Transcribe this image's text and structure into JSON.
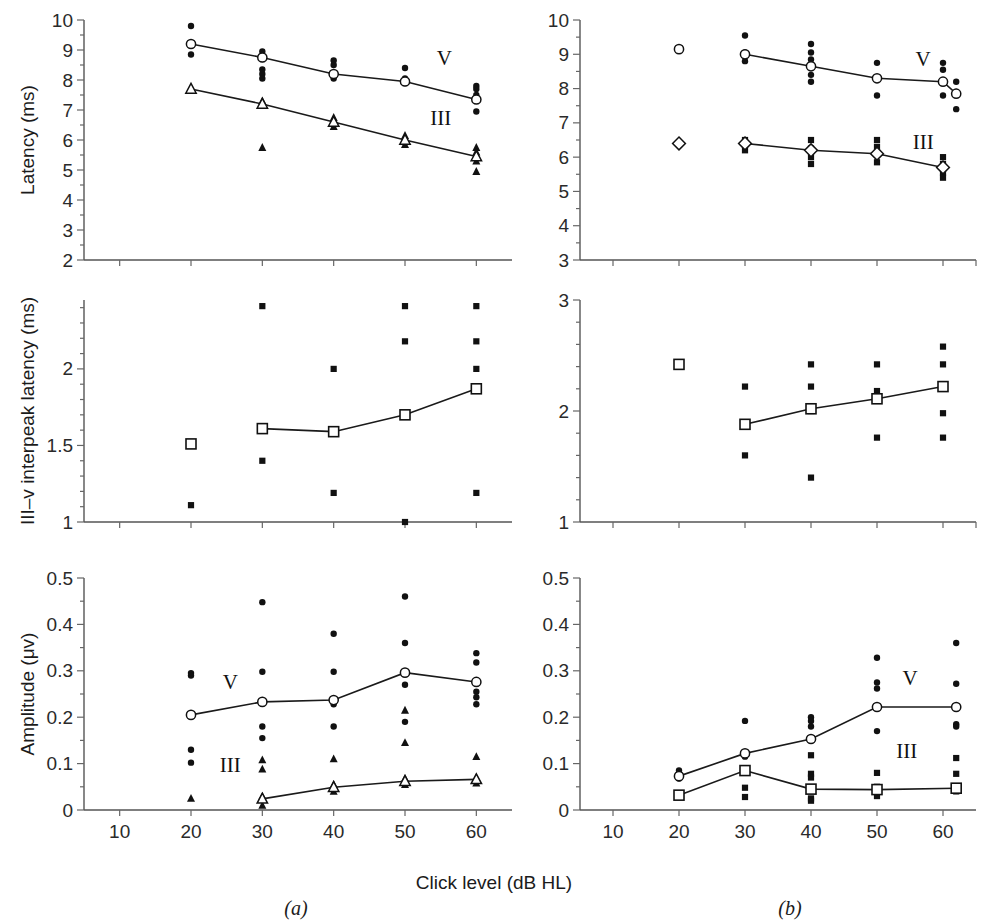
{
  "figure": {
    "xlabel": "Click level (dB HL)",
    "caption_a": "(a)",
    "caption_b": "(b)",
    "series_label_v": "V",
    "series_label_iii": "III",
    "colors": {
      "ink": "#111111",
      "axis": "#555555",
      "background": "#ffffff"
    }
  },
  "chart_data": [
    {
      "id": "panel-a-latency",
      "type": "scatter",
      "title": "",
      "panel": "(a)",
      "xlabel": "Click level (dB HL)",
      "ylabel": "Latency (ms)",
      "xlim": [
        5,
        65
      ],
      "ylim": [
        2,
        10
      ],
      "xticks": [
        10,
        20,
        30,
        40,
        50,
        60
      ],
      "yticks": [
        2,
        3,
        4,
        5,
        6,
        7,
        8,
        9,
        10
      ],
      "grid": false,
      "legend": [
        "V",
        "III"
      ],
      "legend_position": "inline-right",
      "series": [
        {
          "name": "V",
          "marker": "open-circle",
          "x": [
            20,
            30,
            40,
            50,
            60
          ],
          "values": [
            9.2,
            8.75,
            8.2,
            7.95,
            7.35
          ],
          "scatter": {
            "20": [
              9.8,
              9.2,
              8.85
            ],
            "30": [
              8.95,
              8.8,
              8.7,
              8.35,
              8.2,
              8.05
            ],
            "40": [
              8.65,
              8.5,
              8.2,
              8.05
            ],
            "50": [
              8.4,
              8.05,
              7.95,
              7.9
            ],
            "60": [
              7.8,
              7.7,
              7.5,
              7.35,
              6.95
            ]
          }
        },
        {
          "name": "III",
          "marker": "open-triangle",
          "x": [
            20,
            30,
            40,
            50,
            60
          ],
          "values": [
            7.7,
            7.2,
            6.6,
            6.0,
            5.45
          ],
          "scatter": {
            "20": [
              7.7
            ],
            "30": [
              7.3,
              7.2,
              5.75
            ],
            "40": [
              6.75,
              6.6,
              6.45
            ],
            "50": [
              6.15,
              6.0,
              5.85
            ],
            "60": [
              5.75,
              5.6,
              5.45,
              5.3,
              4.95
            ]
          }
        }
      ]
    },
    {
      "id": "panel-b-latency",
      "type": "scatter",
      "title": "",
      "panel": "(b)",
      "xlabel": "Click level (dB HL)",
      "ylabel": "Latency (ms)",
      "xlim": [
        5,
        65
      ],
      "ylim": [
        3,
        10
      ],
      "xticks": [
        10,
        20,
        30,
        40,
        50,
        60
      ],
      "yticks": [
        3,
        4,
        5,
        6,
        7,
        8,
        9,
        10
      ],
      "grid": false,
      "legend": [
        "V",
        "III"
      ],
      "legend_position": "inline-right",
      "series": [
        {
          "name": "V",
          "marker": "open-circle",
          "x": [
            30,
            40,
            50,
            60
          ],
          "values": [
            9.0,
            8.65,
            8.3,
            8.2
          ],
          "isolated": {
            "20": [
              9.15
            ]
          },
          "scatter": {
            "30": [
              9.55,
              9.05,
              8.95,
              8.8
            ],
            "40": [
              9.3,
              9.05,
              8.85,
              8.65,
              8.4,
              8.2
            ],
            "50": [
              8.75,
              8.3,
              7.8
            ],
            "60": [
              8.75,
              8.55,
              8.2,
              7.8
            ]
          },
          "last_x": 62,
          "last_value": 7.85,
          "last_scatter": [
            8.2,
            7.9,
            7.85,
            7.4
          ]
        },
        {
          "name": "III",
          "marker": "open-diamond",
          "x": [
            30,
            40,
            50,
            60
          ],
          "values": [
            6.4,
            6.2,
            6.1,
            5.7
          ],
          "isolated": {
            "20": [
              6.4
            ]
          },
          "scatter": {
            "30": [
              6.5,
              6.4,
              6.2
            ],
            "40": [
              6.5,
              6.25,
              6.0,
              5.8
            ],
            "50": [
              6.5,
              6.3,
              6.1,
              5.85
            ],
            "60": [
              6.0,
              5.8,
              5.7,
              5.55,
              5.4
            ]
          }
        }
      ]
    },
    {
      "id": "panel-a-interpeak",
      "type": "scatter",
      "title": "",
      "panel": "(a)",
      "xlabel": "Click level (dB HL)",
      "ylabel": "III–v interpeak latency (ms)",
      "xlim": [
        5,
        65
      ],
      "ylim": [
        1,
        2.45
      ],
      "xticks": [
        10,
        20,
        30,
        40,
        50,
        60
      ],
      "yticks": [
        1,
        1.5,
        2
      ],
      "grid": false,
      "series": [
        {
          "name": "III-V interpeak",
          "marker": "open-square",
          "x": [
            30,
            40,
            50,
            60
          ],
          "values": [
            1.61,
            1.59,
            1.7,
            1.87
          ],
          "isolated": {
            "20": [
              1.51
            ]
          },
          "scatter": {
            "20": [
              1.51,
              1.11
            ],
            "30": [
              2.41,
              1.62,
              1.6,
              1.4
            ],
            "40": [
              2.0,
              1.6,
              1.19
            ],
            "50": [
              2.41,
              2.18,
              1.7,
              1.0
            ],
            "60": [
              2.41,
              2.18,
              2.0,
              1.87,
              1.19
            ]
          }
        }
      ]
    },
    {
      "id": "panel-b-interpeak",
      "type": "scatter",
      "title": "",
      "panel": "(b)",
      "xlabel": "Click level (dB HL)",
      "ylabel": "III–v interpeak latency (ms)",
      "xlim": [
        5,
        65
      ],
      "ylim": [
        1,
        3
      ],
      "xticks": [
        10,
        20,
        30,
        40,
        50,
        60
      ],
      "yticks": [
        1,
        2,
        3
      ],
      "grid": false,
      "series": [
        {
          "name": "III-V interpeak",
          "marker": "open-square",
          "x": [
            30,
            40,
            50,
            60
          ],
          "values": [
            1.88,
            2.02,
            2.11,
            2.22
          ],
          "isolated": {
            "20": [
              2.42
            ]
          },
          "scatter": {
            "20": [
              2.42
            ],
            "30": [
              2.22,
              1.88,
              1.6
            ],
            "40": [
              2.42,
              2.22,
              2.0,
              1.4
            ],
            "50": [
              2.42,
              2.18,
              2.11,
              1.76
            ],
            "60": [
              2.58,
              2.42,
              2.22,
              1.98,
              1.76
            ]
          }
        }
      ]
    },
    {
      "id": "panel-a-amplitude",
      "type": "scatter",
      "title": "",
      "panel": "(a)",
      "xlabel": "Click level (dB HL)",
      "ylabel": "Amplitude (μv)",
      "xlim": [
        5,
        65
      ],
      "ylim": [
        0,
        0.5
      ],
      "xticks": [
        10,
        20,
        30,
        40,
        50,
        60
      ],
      "yticks": [
        0,
        0.1,
        0.2,
        0.3,
        0.4,
        0.5
      ],
      "grid": false,
      "legend": [
        "V",
        "III"
      ],
      "series": [
        {
          "name": "V",
          "marker": "open-circle",
          "x": [
            20,
            30,
            40,
            50,
            60
          ],
          "values": [
            0.205,
            0.233,
            0.237,
            0.296,
            0.276
          ],
          "scatter": {
            "20": [
              0.295,
              0.29,
              0.205,
              0.13,
              0.102
            ],
            "30": [
              0.448,
              0.298,
              0.233,
              0.18,
              0.155
            ],
            "40": [
              0.38,
              0.298,
              0.237,
              0.228,
              0.18
            ],
            "50": [
              0.46,
              0.36,
              0.296,
              0.27,
              0.19
            ],
            "60": [
              0.338,
              0.318,
              0.276,
              0.255,
              0.243,
              0.228
            ]
          }
        },
        {
          "name": "III",
          "marker": "open-triangle",
          "x": [
            30,
            40,
            50,
            60
          ],
          "values": [
            0.024,
            0.049,
            0.062,
            0.066
          ],
          "scatter": {
            "20": [
              0.025
            ],
            "30": [
              0.108,
              0.088,
              0.03,
              0.024,
              0.01
            ],
            "40": [
              0.11,
              0.055,
              0.049,
              0.04
            ],
            "50": [
              0.215,
              0.145,
              0.068,
              0.062,
              0.055
            ],
            "60": [
              0.115,
              0.07,
              0.066,
              0.058
            ]
          }
        }
      ]
    },
    {
      "id": "panel-b-amplitude",
      "type": "scatter",
      "title": "",
      "panel": "(b)",
      "xlabel": "Click level (dB HL)",
      "ylabel": "Amplitude (μv)",
      "xlim": [
        5,
        65
      ],
      "ylim": [
        0,
        0.5
      ],
      "xticks": [
        10,
        20,
        30,
        40,
        50,
        60
      ],
      "yticks": [
        0,
        0.1,
        0.2,
        0.3,
        0.4,
        0.5
      ],
      "grid": false,
      "legend": [
        "V",
        "III"
      ],
      "series": [
        {
          "name": "V",
          "marker": "open-circle",
          "x": [
            20,
            30,
            40,
            50,
            62
          ],
          "values": [
            0.073,
            0.122,
            0.153,
            0.222,
            0.222
          ],
          "scatter": {
            "20": [
              0.085,
              0.078,
              0.073,
              0.068
            ],
            "30": [
              0.192,
              0.122,
              0.115
            ],
            "40": [
              0.2,
              0.192,
              0.18,
              0.153
            ],
            "50": [
              0.328,
              0.275,
              0.262,
              0.222,
              0.17
            ],
            "62": [
              0.36,
              0.272,
              0.222,
              0.185,
              0.18
            ]
          }
        },
        {
          "name": "III",
          "marker": "open-square",
          "x": [
            20,
            30,
            40,
            50,
            62
          ],
          "values": [
            0.032,
            0.085,
            0.045,
            0.044,
            0.047
          ],
          "scatter": {
            "20": [
              0.035,
              0.03
            ],
            "30": [
              0.085,
              0.048,
              0.028
            ],
            "40": [
              0.118,
              0.078,
              0.07,
              0.045,
              0.025,
              0.02
            ],
            "50": [
              0.08,
              0.05,
              0.044,
              0.03
            ],
            "62": [
              0.112,
              0.078,
              0.05,
              0.04
            ]
          }
        }
      ]
    }
  ]
}
